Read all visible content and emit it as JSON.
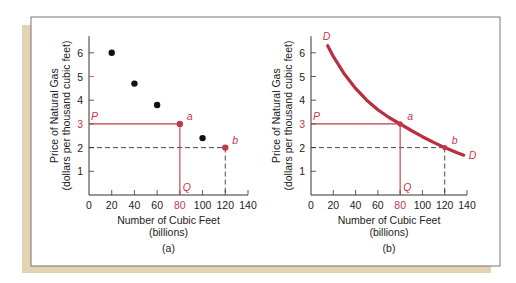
{
  "colors": {
    "accent": "#c0394b",
    "curve": "#b8303f",
    "axis": "#333333",
    "dots": "#111111",
    "shadow": "#e3d3b3",
    "frame": "#555555"
  },
  "chart_data": [
    {
      "id": "a",
      "type": "scatter",
      "caption": "(a)",
      "xlabel": "Number of Cubic Feet",
      "xlabel2": "(billions)",
      "ylabel": "Price of Natural Gas",
      "ylabel2": "(dollars per thousand cubic feet)",
      "xlim": [
        0,
        140
      ],
      "ylim": [
        0,
        6.7
      ],
      "xticks": [
        0,
        20,
        40,
        60,
        80,
        100,
        120,
        140
      ],
      "yticks": [
        1,
        2,
        3,
        4,
        5,
        6
      ],
      "highlight_xtick": 80,
      "highlight_ytick": 3,
      "grid": false,
      "points": [
        {
          "x": 20,
          "y": 6.0
        },
        {
          "x": 40,
          "y": 4.7
        },
        {
          "x": 60,
          "y": 3.8
        },
        {
          "x": 100,
          "y": 2.4
        }
      ],
      "highlight_points": [
        {
          "x": 80,
          "y": 3,
          "label": "a"
        },
        {
          "x": 120,
          "y": 2,
          "label": "b"
        }
      ],
      "solid_guides": {
        "x": 80,
        "y": 3,
        "p_label": "P",
        "q_label": "Q"
      },
      "dashed_guides": {
        "x": 120,
        "y": 2
      }
    },
    {
      "id": "b",
      "type": "line",
      "caption": "(b)",
      "xlabel": "Number of Cubic Feet",
      "xlabel2": "(billions)",
      "ylabel": "Price of Natural Gas",
      "ylabel2": "(dollars per thousand cubic feet)",
      "xlim": [
        0,
        140
      ],
      "ylim": [
        0,
        6.7
      ],
      "xticks": [
        0,
        20,
        40,
        60,
        80,
        100,
        120,
        140
      ],
      "yticks": [
        1,
        2,
        3,
        4,
        5,
        6
      ],
      "highlight_xtick": 80,
      "highlight_ytick": 3,
      "grid": false,
      "series": [
        {
          "name": "D",
          "label_start": "D",
          "label_end": "D",
          "x": [
            15,
            20,
            30,
            40,
            50,
            60,
            70,
            80,
            90,
            100,
            110,
            120,
            130,
            137
          ],
          "y": [
            6.3,
            5.85,
            5.1,
            4.5,
            4.0,
            3.6,
            3.27,
            3.0,
            2.72,
            2.46,
            2.22,
            2.0,
            1.8,
            1.68
          ]
        }
      ],
      "highlight_points": [
        {
          "x": 80,
          "y": 3,
          "label": "a"
        },
        {
          "x": 120,
          "y": 2,
          "label": "b"
        }
      ],
      "solid_guides": {
        "x": 80,
        "y": 3,
        "p_label": "P",
        "q_label": "Q"
      },
      "dashed_guides": {
        "x": 120,
        "y": 2
      }
    }
  ]
}
